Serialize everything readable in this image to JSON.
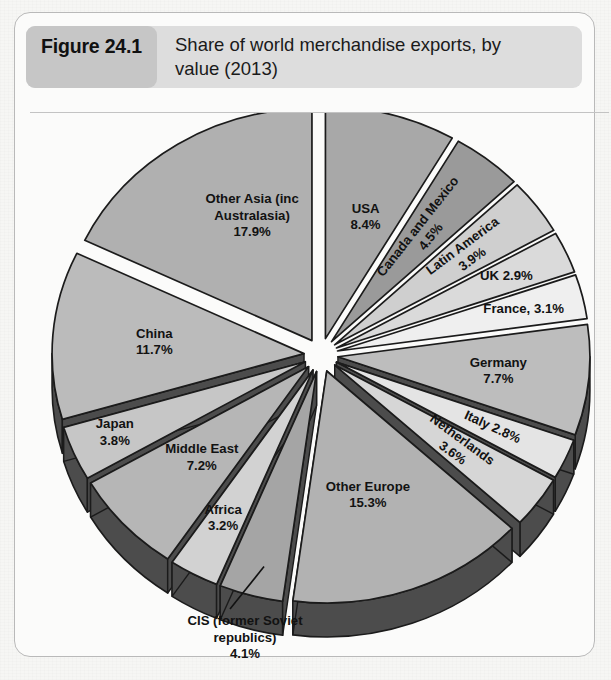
{
  "figure": {
    "number": "Figure 24.1",
    "title_line1": "Share of world merchandise exports, by",
    "title_line2": "value (2013)"
  },
  "chart_data": {
    "type": "pie",
    "title": "Share of world merchandise exports, by value (2013)",
    "unit": "percent",
    "exploded": true,
    "three_d": true,
    "legend_position": "none",
    "labels_on_slices": true,
    "categories": [
      "USA",
      "Canada and Mexico",
      "Latin America",
      "UK",
      "France",
      "Germany",
      "Italy",
      "Netherlands",
      "Other Europe",
      "CIS (former Soviet republics)",
      "Africa",
      "Middle East",
      "Japan",
      "China",
      "Other Asia (inc Australasia)"
    ],
    "values": [
      8.4,
      4.5,
      3.9,
      2.9,
      3.1,
      7.7,
      2.8,
      3.6,
      15.3,
      4.1,
      3.2,
      7.2,
      3.8,
      11.7,
      17.9
    ],
    "slices": [
      {
        "name": "USA",
        "value": 8.4,
        "label_line1": "USA",
        "label_line2": "8.4%",
        "label_text": "USA 8.4%",
        "fill": "#a8a8a8",
        "callout": false
      },
      {
        "name": "Canada and Mexico",
        "value": 4.5,
        "label_line1": "Canada and Mexico",
        "label_line2": "4.5%",
        "label_text": "Canada and Mexico 4.5%",
        "fill": "#9a9a9a",
        "callout": false
      },
      {
        "name": "Latin America",
        "value": 3.9,
        "label_line1": "Latin America",
        "label_line2": "3.9%",
        "label_text": "Latin America 3.9%",
        "fill": "#cfcfcf",
        "callout": false
      },
      {
        "name": "UK",
        "value": 2.9,
        "label_line1": "UK 2.9%",
        "label_line2": "",
        "label_text": "UK 2.9%",
        "fill": "#dadada",
        "callout": false
      },
      {
        "name": "France",
        "value": 3.1,
        "label_line1": "France, 3.1%",
        "label_line2": "",
        "label_text": "France, 3.1%",
        "fill": "#efefef",
        "callout": false
      },
      {
        "name": "Germany",
        "value": 7.7,
        "label_line1": "Germany",
        "label_line2": "7.7%",
        "label_text": "Germany 7.7%",
        "fill": "#bdbdbd",
        "callout": false
      },
      {
        "name": "Italy",
        "value": 2.8,
        "label_line1": "Italy 2.8%",
        "label_line2": "",
        "label_text": "Italy 2.8%",
        "fill": "#e4e4e4",
        "callout": false
      },
      {
        "name": "Netherlands",
        "value": 3.6,
        "label_line1": "Netherlands",
        "label_line2": "3.6%",
        "label_text": "Netherlands 3.6%",
        "fill": "#d6d6d6",
        "callout": false
      },
      {
        "name": "Other Europe",
        "value": 15.3,
        "label_line1": "Other Europe",
        "label_line2": "15.3%",
        "label_text": "Other Europe 15.3%",
        "fill": "#b2b2b2",
        "callout": false
      },
      {
        "name": "CIS (former Soviet republics)",
        "value": 4.1,
        "label_line1": "CIS (former Soviet",
        "label_line2": "republics)",
        "label_line3": "4.1%",
        "label_text": "CIS (former Soviet republics) 4.1%",
        "fill": "#a5a5a5",
        "callout": true
      },
      {
        "name": "Africa",
        "value": 3.2,
        "label_line1": "Africa",
        "label_line2": "3.2%",
        "label_text": "Africa 3.2%",
        "fill": "#d2d2d2",
        "callout": false
      },
      {
        "name": "Middle East",
        "value": 7.2,
        "label_line1": "Middle East",
        "label_line2": "7.2%",
        "label_text": "Middle East 7.2%",
        "fill": "#b6b6b6",
        "callout": false
      },
      {
        "name": "Japan",
        "value": 3.8,
        "label_line1": "Japan",
        "label_line2": "3.8%",
        "label_text": "Japan 3.8%",
        "fill": "#c6c6c6",
        "callout": false
      },
      {
        "name": "China",
        "value": 11.7,
        "label_line1": "China",
        "label_line2": "11.7%",
        "label_text": "China 11.7%",
        "fill": "#bbbbbb",
        "callout": false
      },
      {
        "name": "Other Asia (inc Australasia)",
        "value": 17.9,
        "label_line1": "Other Asia (inc",
        "label_line2": "Australasia)",
        "label_line3": "17.9%",
        "label_text": "Other Asia (inc Australasia) 17.9%",
        "fill": "#b0b0b0",
        "callout": false
      }
    ],
    "colors": {
      "side_depth": "#4c4c4c",
      "outline": "#1b1b1b",
      "background": "#fbfbfa"
    }
  }
}
